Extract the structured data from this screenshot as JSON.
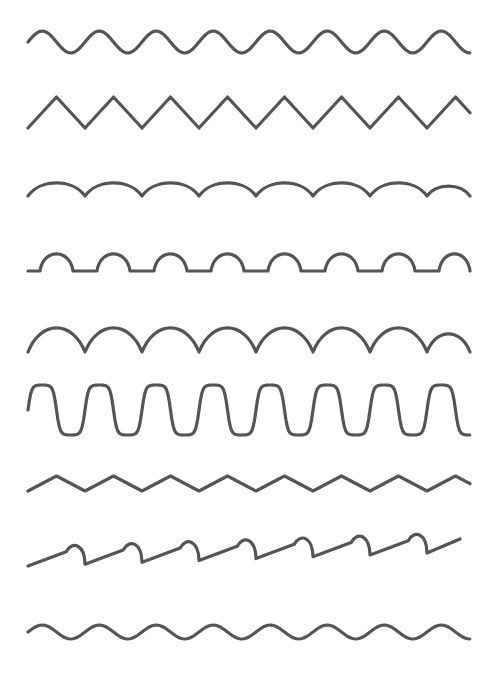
{
  "worksheet": {
    "title": "Pattern Tracing Practice Sheet",
    "background_color": "#ffffff",
    "stroke_color": "#555555",
    "stroke_width": 3.2,
    "width": 496,
    "height": 674,
    "row_count": 9,
    "rows": [
      {
        "index": 1,
        "name": "sine-wave-medium",
        "label": "Sine wave",
        "shape": "sine",
        "baseline_y": 42,
        "amplitude": 11,
        "period": 57,
        "x_start": 28,
        "x_end": 470,
        "repeats": 7.8
      },
      {
        "index": 2,
        "name": "zigzag-tall",
        "label": "Tall zigzag",
        "shape": "zigzag",
        "baseline_y": 128,
        "amplitude": 31,
        "period": 57,
        "x_start": 28,
        "x_end": 470,
        "repeats": 7.8
      },
      {
        "index": 3,
        "name": "arch-shallow",
        "label": "Shallow arches",
        "shape": "arch",
        "baseline_y": 196,
        "amplitude": 13,
        "period": 57,
        "x_start": 28,
        "x_end": 470,
        "repeats": 7.8
      },
      {
        "index": 4,
        "name": "bump-with-flat",
        "label": "Bumps with flat gaps",
        "shape": "bump_flat",
        "baseline_y": 271,
        "amplitude": 17,
        "period": 57,
        "bump_width": 33,
        "flat_width": 24,
        "x_start": 28,
        "x_end": 470,
        "repeats": 7.8
      },
      {
        "index": 5,
        "name": "arch-semicircle",
        "label": "Touching semicircle arches",
        "shape": "arch",
        "baseline_y": 352,
        "amplitude": 24,
        "period": 57,
        "x_start": 28,
        "x_end": 470,
        "repeats": 7.8
      },
      {
        "index": 6,
        "name": "square-wave-rounded",
        "label": "Rounded square wave",
        "shape": "square_rounded",
        "baseline_y": 410,
        "amplitude": 25,
        "period": 57,
        "x_start": 28,
        "x_end": 470,
        "repeats": 7.8
      },
      {
        "index": 7,
        "name": "zigzag-shallow",
        "label": "Shallow zigzag",
        "shape": "zigzag",
        "baseline_y": 491,
        "amplitude": 15,
        "period": 57,
        "x_start": 28,
        "x_end": 470,
        "repeats": 7.8
      },
      {
        "index": 8,
        "name": "cursive-loop-slope",
        "label": "Sloped cursive humps",
        "shape": "sloped_hump",
        "baseline_y": 566,
        "amplitude": 13,
        "period": 57,
        "slope": -14,
        "x_start": 28,
        "x_end": 460,
        "repeats": 7.6
      },
      {
        "index": 9,
        "name": "sine-wave-low",
        "label": "Low sine wave",
        "shape": "sine",
        "baseline_y": 632,
        "amplitude": 7,
        "period": 57,
        "x_start": 28,
        "x_end": 470,
        "repeats": 7.8
      }
    ]
  }
}
